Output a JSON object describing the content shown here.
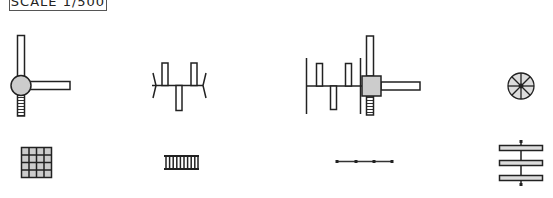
{
  "scale_label": "SCALE 1/500",
  "colors": {
    "stroke": "#222222",
    "fill_gray": "#cccccc",
    "fill_white": "#ffffff"
  },
  "symbols": [
    {
      "id": "tee-valve-round",
      "row": 1,
      "col": 1
    },
    {
      "id": "pipe-manifold-open",
      "row": 1,
      "col": 2
    },
    {
      "id": "manifold-with-square-tee",
      "row": 1,
      "col": 3
    },
    {
      "id": "spoked-wheel",
      "row": 1,
      "col": 4
    },
    {
      "id": "grid-tile",
      "row": 2,
      "col": 1
    },
    {
      "id": "ladder-rail",
      "row": 2,
      "col": 2
    },
    {
      "id": "dotted-chain-line",
      "row": 2,
      "col": 3
    },
    {
      "id": "triple-bar-rack",
      "row": 2,
      "col": 4
    }
  ]
}
